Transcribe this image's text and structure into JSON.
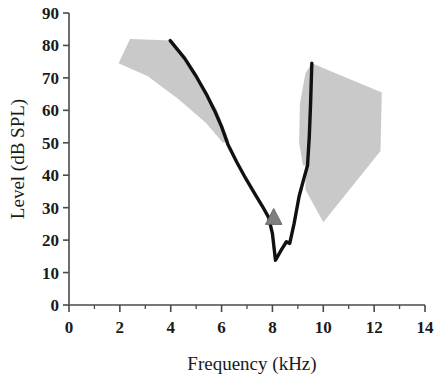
{
  "chart_data": {
    "type": "line",
    "title": "",
    "subtitle": "",
    "xlabel": "Frequency (kHz)",
    "ylabel": "Level (dB SPL)",
    "xlim": [
      0,
      14
    ],
    "ylim": [
      0,
      90
    ],
    "xticks": [
      0,
      2,
      4,
      6,
      8,
      10,
      12,
      14
    ],
    "xtick_labels": [
      "0",
      "2",
      "4",
      "6",
      "8",
      "10",
      "12",
      "14"
    ],
    "xminor_ticks": [
      1,
      3,
      5,
      7,
      9,
      11,
      13
    ],
    "yticks": [
      0,
      10,
      20,
      30,
      40,
      50,
      60,
      70,
      80,
      90
    ],
    "ytick_labels": [
      "0",
      "10",
      "20",
      "30",
      "40",
      "50",
      "60",
      "70",
      "80",
      "90"
    ],
    "grid": false,
    "legend": null,
    "legend_position": "none",
    "series": [
      {
        "name": "Tuning curve",
        "type": "line",
        "color": "#111111",
        "points": [
          [
            3.98,
            81.5
          ],
          [
            4.55,
            76.0
          ],
          [
            5.0,
            70.5
          ],
          [
            5.4,
            65.0
          ],
          [
            5.75,
            59.5
          ],
          [
            6.0,
            55.0
          ],
          [
            6.25,
            49.5
          ],
          [
            6.6,
            44.0
          ],
          [
            6.95,
            39.0
          ],
          [
            7.25,
            35.0
          ],
          [
            7.6,
            30.5
          ],
          [
            7.85,
            27.0
          ],
          [
            8.0,
            22.0
          ],
          [
            8.12,
            13.8
          ],
          [
            8.35,
            17.0
          ],
          [
            8.55,
            19.5
          ],
          [
            8.68,
            19.0
          ],
          [
            8.85,
            25.0
          ],
          [
            9.05,
            33.5
          ],
          [
            9.22,
            38.5
          ],
          [
            9.38,
            43.0
          ],
          [
            9.45,
            52.0
          ],
          [
            9.5,
            62.0
          ],
          [
            9.55,
            74.5
          ]
        ]
      }
    ],
    "shaded_regions": [
      {
        "name": "Low-frequency normal range",
        "color": "#c9c9c9",
        "vertices": [
          [
            2.4,
            82.0
          ],
          [
            4.05,
            81.5
          ],
          [
            5.0,
            70.0
          ],
          [
            5.8,
            60.5
          ],
          [
            6.3,
            50.5
          ],
          [
            6.05,
            50.0
          ],
          [
            5.4,
            56.0
          ],
          [
            4.3,
            63.5
          ],
          [
            3.1,
            70.5
          ],
          [
            1.95,
            74.5
          ]
        ]
      },
      {
        "name": "High-frequency normal range",
        "color": "#c9c9c9",
        "vertices": [
          [
            9.55,
            74.5
          ],
          [
            12.3,
            65.5
          ],
          [
            12.25,
            47.5
          ],
          [
            10.0,
            25.5
          ],
          [
            9.3,
            35.5
          ],
          [
            9.3,
            43.0
          ],
          [
            9.2,
            43.0
          ],
          [
            9.05,
            50.0
          ],
          [
            9.08,
            62.0
          ],
          [
            9.3,
            71.5
          ]
        ]
      }
    ],
    "markers": [
      {
        "name": "Threshold marker",
        "shape": "triangle",
        "color": "#808080",
        "edge_color": "#5a5a5a",
        "x": 8.05,
        "y": 27.0
      }
    ]
  }
}
